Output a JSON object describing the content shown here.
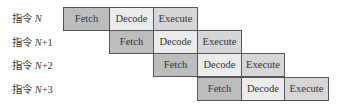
{
  "diagram": {
    "type": "instruction-pipeline",
    "stage_names": [
      "Fetch",
      "Decode",
      "Execute"
    ],
    "colors": {
      "fetch": "#bdbdbd",
      "decode": "#ebebeb",
      "execute": "#d6d6d6",
      "border": "#555555"
    },
    "rows": [
      {
        "label_prefix": "指令 ",
        "label_var": "N",
        "label_suffix": "",
        "start_slot": 0,
        "stages": [
          "Fetch",
          "Decode",
          "Execute"
        ]
      },
      {
        "label_prefix": "指令 ",
        "label_var": "N",
        "label_suffix": "+1",
        "start_slot": 1,
        "stages": [
          "Fetch",
          "Decode",
          "Execute"
        ]
      },
      {
        "label_prefix": "指令 ",
        "label_var": "N",
        "label_suffix": "+2",
        "start_slot": 2,
        "stages": [
          "Fetch",
          "Decode",
          "Execute"
        ]
      },
      {
        "label_prefix": "指令 ",
        "label_var": "N",
        "label_suffix": "+3",
        "start_slot": 3,
        "stages": [
          "Fetch",
          "Decode",
          "Execute"
        ]
      }
    ]
  }
}
